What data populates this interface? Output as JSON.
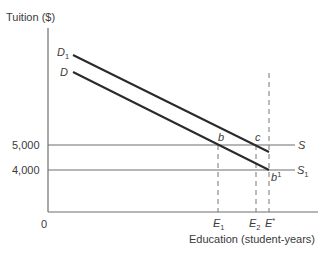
{
  "diagram": {
    "y_axis_label": "Tuition ($)",
    "x_axis_label": "Education (student-years)",
    "origin_label": "0",
    "y_ticks": [
      {
        "label": "5,000",
        "y": 145
      },
      {
        "label": "4,000",
        "y": 170
      }
    ],
    "curves": [
      {
        "name": "D",
        "sub": "1",
        "type": "demand",
        "from": [
          73,
          55
        ],
        "to": [
          269,
          152
        ]
      },
      {
        "name": "D",
        "sub": "",
        "type": "demand",
        "from": [
          73,
          72
        ],
        "to": [
          269,
          170
        ]
      },
      {
        "name": "S",
        "sub": "",
        "type": "supply",
        "y": 145
      },
      {
        "name": "S",
        "sub": "1",
        "type": "supply",
        "y": 170
      }
    ],
    "points": [
      {
        "label": "b",
        "sup": ""
      },
      {
        "label": "c",
        "sup": ""
      },
      {
        "label": "b",
        "sup": "1"
      }
    ],
    "x_markers": [
      {
        "name": "E",
        "sub": "1",
        "x": 218
      },
      {
        "name": "E",
        "sub": "2",
        "x": 256
      },
      {
        "name": "E",
        "sup": "*",
        "x": 269
      }
    ],
    "line_color": "#2a2a2a",
    "axis_color": "#6e6e6e"
  }
}
